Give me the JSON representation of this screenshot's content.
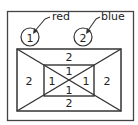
{
  "legend": {
    "items": [
      {
        "number": "1",
        "color_name": "red"
      },
      {
        "number": "2",
        "color_name": "blue"
      }
    ]
  },
  "diagram": {
    "regions": {
      "outer_top": "2",
      "outer_left": "2",
      "outer_right": "2",
      "outer_bottom": "2",
      "inner_top": "1",
      "inner_left": "1",
      "inner_right": "1",
      "inner_bottom": "1"
    }
  },
  "colors": {
    "stroke": "#333333",
    "background": "#ffffff"
  }
}
